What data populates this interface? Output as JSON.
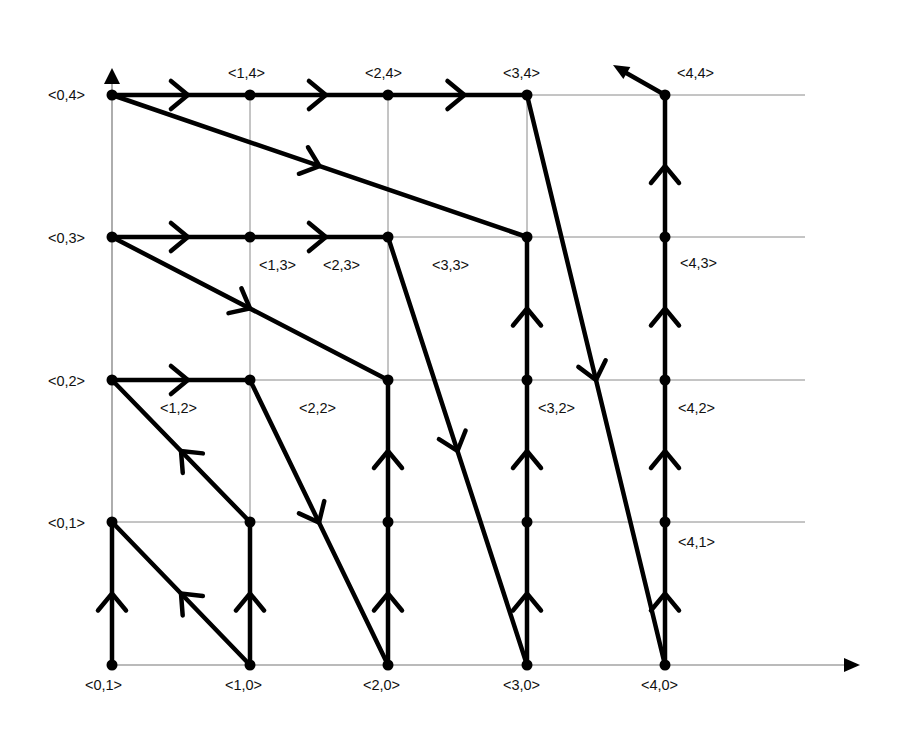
{
  "diagram": {
    "type": "lattice-path-graph",
    "grid": {
      "cols_x": [
        112,
        250,
        388,
        527,
        665
      ],
      "rows_y": [
        665,
        522,
        380,
        237,
        95
      ],
      "x_end": 805,
      "y_top": 70
    },
    "axes": {
      "x_axis": {
        "from": [
          112,
          665
        ],
        "to": [
          860,
          665
        ]
      },
      "y_axis": {
        "from": [
          112,
          665
        ],
        "to": [
          112,
          68
        ]
      }
    },
    "labels": [
      {
        "text": "<0,4>",
        "x": 48,
        "y": 100
      },
      {
        "text": "<1,4>",
        "x": 228,
        "y": 78
      },
      {
        "text": "<2,4>",
        "x": 365,
        "y": 78
      },
      {
        "text": "<3,4>",
        "x": 503,
        "y": 78
      },
      {
        "text": "<4,4>",
        "x": 677,
        "y": 78
      },
      {
        "text": "<0,3>",
        "x": 48,
        "y": 243
      },
      {
        "text": "<1,3>",
        "x": 259,
        "y": 270
      },
      {
        "text": "<2,3>",
        "x": 323,
        "y": 270
      },
      {
        "text": "<3,3>",
        "x": 432,
        "y": 270
      },
      {
        "text": "<4,3>",
        "x": 680,
        "y": 268
      },
      {
        "text": "<0,2>",
        "x": 48,
        "y": 386
      },
      {
        "text": "<1,2>",
        "x": 160,
        "y": 413
      },
      {
        "text": "<2,2>",
        "x": 299,
        "y": 413
      },
      {
        "text": "<3,2>",
        "x": 538,
        "y": 413
      },
      {
        "text": "<4,2>",
        "x": 678,
        "y": 413
      },
      {
        "text": "<0,1>",
        "x": 48,
        "y": 528
      },
      {
        "text": "<4,1>",
        "x": 678,
        "y": 547
      },
      {
        "text": "<0,1>",
        "x": 85,
        "y": 690
      },
      {
        "text": "<1,0>",
        "x": 225,
        "y": 690
      },
      {
        "text": "<2,0>",
        "x": 363,
        "y": 690
      },
      {
        "text": "<3,0>",
        "x": 503,
        "y": 690
      },
      {
        "text": "<4,0>",
        "x": 641,
        "y": 690
      }
    ],
    "nodes": [
      [
        0,
        0
      ],
      [
        1,
        0
      ],
      [
        2,
        0
      ],
      [
        3,
        0
      ],
      [
        4,
        0
      ],
      [
        0,
        1
      ],
      [
        1,
        1
      ],
      [
        2,
        1
      ],
      [
        3,
        1
      ],
      [
        4,
        1
      ],
      [
        0,
        2
      ],
      [
        1,
        2
      ],
      [
        2,
        2
      ],
      [
        3,
        2
      ],
      [
        4,
        2
      ],
      [
        0,
        3
      ],
      [
        1,
        3
      ],
      [
        2,
        3
      ],
      [
        3,
        3
      ],
      [
        4,
        3
      ],
      [
        0,
        4
      ],
      [
        1,
        4
      ],
      [
        2,
        4
      ],
      [
        3,
        4
      ],
      [
        4,
        4
      ]
    ],
    "edges": [
      {
        "from": [
          0,
          0
        ],
        "to": [
          0,
          1
        ],
        "arrow_t": 0.5
      },
      {
        "from": [
          0,
          1
        ],
        "to": [
          1,
          0
        ],
        "arrow_t": 0.5,
        "reverse": true
      },
      {
        "from": [
          1,
          0
        ],
        "to": [
          1,
          1
        ],
        "arrow_t": 0.5
      },
      {
        "from": [
          1,
          1
        ],
        "to": [
          0,
          2
        ],
        "arrow_t": 0.5
      },
      {
        "from": [
          0,
          2
        ],
        "to": [
          1,
          2
        ],
        "arrow_t": 0.55
      },
      {
        "from": [
          1,
          2
        ],
        "to": [
          2,
          0
        ],
        "arrow_t": 0.5
      },
      {
        "from": [
          2,
          0
        ],
        "to": [
          2,
          1
        ],
        "arrow_t": 0.5
      },
      {
        "from": [
          2,
          1
        ],
        "to": [
          2,
          2
        ],
        "arrow_t": 0.5
      },
      {
        "from": [
          2,
          2
        ],
        "to": [
          0,
          3
        ],
        "arrow_t": 0.5,
        "reverse": true
      },
      {
        "from": [
          0,
          3
        ],
        "to": [
          1,
          3
        ],
        "arrow_t": 0.55
      },
      {
        "from": [
          1,
          3
        ],
        "to": [
          2,
          3
        ],
        "arrow_t": 0.55
      },
      {
        "from": [
          2,
          3
        ],
        "to": [
          3,
          0
        ],
        "arrow_t": 0.5
      },
      {
        "from": [
          3,
          0
        ],
        "to": [
          3,
          1
        ],
        "arrow_t": 0.5
      },
      {
        "from": [
          3,
          1
        ],
        "to": [
          3,
          2
        ],
        "arrow_t": 0.5
      },
      {
        "from": [
          3,
          2
        ],
        "to": [
          3,
          3
        ],
        "arrow_t": 0.5
      },
      {
        "from": [
          3,
          3
        ],
        "to": [
          0,
          4
        ],
        "arrow_t": 0.5,
        "reverse": true
      },
      {
        "from": [
          0,
          4
        ],
        "to": [
          1,
          4
        ],
        "arrow_t": 0.55
      },
      {
        "from": [
          1,
          4
        ],
        "to": [
          2,
          4
        ],
        "arrow_t": 0.55
      },
      {
        "from": [
          2,
          4
        ],
        "to": [
          3,
          4
        ],
        "arrow_t": 0.55
      },
      {
        "from": [
          3,
          4
        ],
        "to": [
          4,
          0
        ],
        "arrow_t": 0.5
      },
      {
        "from": [
          4,
          0
        ],
        "to": [
          4,
          1
        ],
        "arrow_t": 0.5
      },
      {
        "from": [
          4,
          1
        ],
        "to": [
          4,
          2
        ],
        "arrow_t": 0.5
      },
      {
        "from": [
          4,
          2
        ],
        "to": [
          4,
          3
        ],
        "arrow_t": 0.5
      },
      {
        "from": [
          4,
          3
        ],
        "to": [
          4,
          4
        ],
        "arrow_t": 0.5
      }
    ],
    "exit_arrow": {
      "from": [
        665,
        95
      ],
      "to": [
        613,
        65
      ]
    }
  }
}
